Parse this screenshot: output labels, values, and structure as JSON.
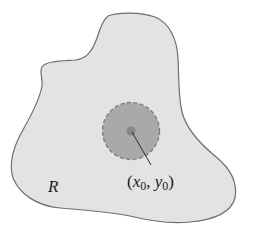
{
  "diagram": {
    "region_label": "R",
    "point_label": {
      "open": "(",
      "x": "x",
      "x_sub": "0",
      "sep": ", ",
      "y": "y",
      "y_sub": "0",
      "close": ")"
    },
    "colors": {
      "background": "#ffffff",
      "region_fill": "#e3e3e3",
      "region_stroke": "#6f6f6f",
      "disk_fill": "#a9a9a9",
      "disk_stroke": "#7f7f7f",
      "center_dot": "#878787",
      "leader_line": "#2b2b2b"
    }
  }
}
